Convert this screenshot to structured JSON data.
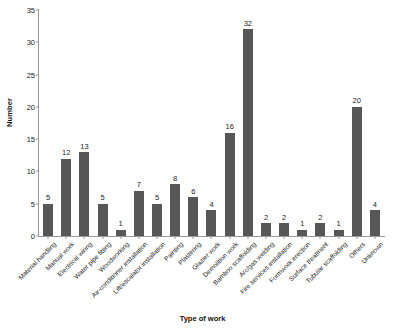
{
  "chart_data": {
    "type": "bar",
    "title": "",
    "subtitle": "",
    "xlabel": "Type of work",
    "ylabel": "Number",
    "ylim": [
      0,
      35
    ],
    "yticks": [
      0,
      5,
      10,
      15,
      20,
      25,
      30,
      35
    ],
    "grid": false,
    "legend": null,
    "bar_color": "#575757",
    "axis_color": "#9a9a9a",
    "show_value_labels": true,
    "categories": [
      "Material handling",
      "Manual work",
      "Electrical wiring",
      "Water pipe fitting",
      "Woodworking",
      "Air-conditioner installation",
      "Lift/escalator installation",
      "Painting",
      "Plastering",
      "Glazier work",
      "Demolition work",
      "Bamboo scaffolding",
      "Arc/gas welding",
      "Fire services installation",
      "Formwork erection",
      "Surface treatment",
      "Tubular scaffolding",
      "Others",
      "Unknown"
    ],
    "values": [
      5,
      12,
      13,
      5,
      1,
      7,
      5,
      8,
      6,
      4,
      16,
      32,
      2,
      2,
      1,
      2,
      1,
      20,
      4
    ]
  }
}
